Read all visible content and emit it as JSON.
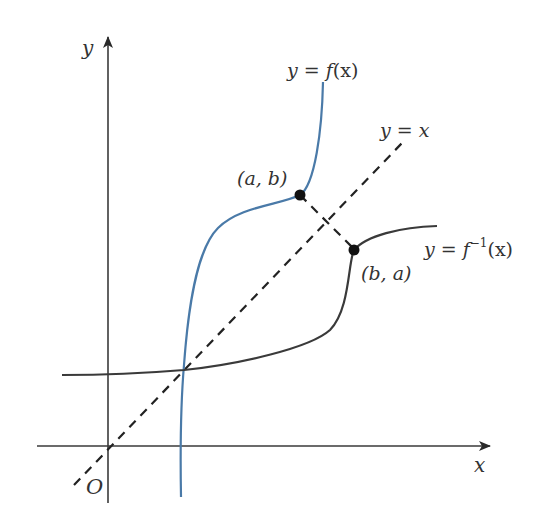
{
  "diagram": {
    "axes": {
      "x_label": "x",
      "y_label": "y",
      "origin_label": "O"
    },
    "curves": {
      "f": {
        "label_prefix": "y = f",
        "label_arg": "(x)",
        "color": "#4a7aa8"
      },
      "f_inverse": {
        "label_prefix": "y = f",
        "label_sup": "−1",
        "label_arg": "(x)",
        "color": "#3a3a3a"
      },
      "identity": {
        "label": "y = x",
        "color": "#222222",
        "style": "dashed"
      }
    },
    "points": [
      {
        "label": "(a, b)",
        "on": "f"
      },
      {
        "label": "(b, a)",
        "on": "f_inverse"
      }
    ],
    "colors": {
      "axis": "#333333",
      "point": "#111111",
      "background": "#ffffff"
    }
  }
}
